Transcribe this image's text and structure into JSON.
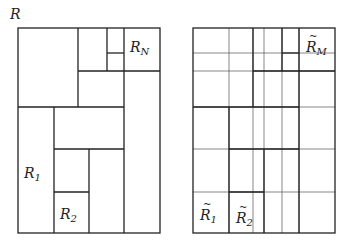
{
  "diagram": {
    "title_label": "R",
    "left_panel": {
      "name": "partition",
      "box": {
        "x": 18,
        "y": 28,
        "w": 142,
        "h": 205
      },
      "segments": [
        [
          78,
          28,
          78,
          107
        ],
        [
          107,
          28,
          107,
          71
        ],
        [
          124,
          28,
          124,
          233
        ],
        [
          107,
          53,
          124,
          53
        ],
        [
          78,
          71,
          160,
          71
        ],
        [
          18,
          107,
          124,
          107
        ],
        [
          54,
          107,
          54,
          233
        ],
        [
          54,
          149,
          124,
          149
        ],
        [
          89,
          149,
          89,
          233
        ],
        [
          54,
          192,
          89,
          192
        ]
      ],
      "labels": [
        {
          "id": "R_N",
          "base": "R",
          "sub": "N",
          "x": 130,
          "y": 40
        },
        {
          "id": "R_1",
          "base": "R",
          "sub": "1",
          "x": 24,
          "y": 166
        },
        {
          "id": "R_2",
          "base": "R",
          "sub": "2",
          "x": 60,
          "y": 207
        }
      ]
    },
    "right_panel": {
      "name": "grid-refinement",
      "box": {
        "x": 193,
        "y": 28,
        "w": 142,
        "h": 205
      },
      "grid_x": [
        229,
        253,
        264,
        282,
        299
      ],
      "grid_y": [
        53,
        71,
        107,
        149,
        192
      ],
      "labels": [
        {
          "id": "Rt_M",
          "base": "R",
          "sub": "M",
          "x": 306,
          "y": 40,
          "tilde": true
        },
        {
          "id": "Rt_1",
          "base": "R",
          "sub": "1",
          "x": 200,
          "y": 208,
          "tilde": true
        },
        {
          "id": "Rt_2",
          "base": "R",
          "sub": "2",
          "x": 236,
          "y": 211,
          "tilde": true
        }
      ]
    },
    "colors": {
      "line": "#222222",
      "thin_line": "#555555",
      "background": "#ffffff"
    }
  }
}
